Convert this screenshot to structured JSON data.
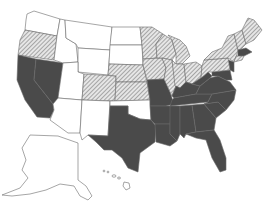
{
  "map": {
    "type": "choropleth",
    "region": "United States",
    "colors": {
      "none": "#ffffff",
      "hatched": "#b8b8b8",
      "dark": "#4a4a4a",
      "border": "#6a6a6a"
    },
    "categories": {
      "none": [
        "WA",
        "ID",
        "MT",
        "WY",
        "ND",
        "SD",
        "UT",
        "AZ",
        "NM",
        "OK",
        "AK",
        "HI"
      ],
      "hatched": [
        "OR",
        "CO",
        "NE",
        "KS",
        "MN",
        "IA",
        "WI",
        "IL",
        "MI",
        "IN",
        "OH",
        "PA",
        "NY",
        "VT",
        "NH",
        "ME",
        "MA",
        "CT",
        "RI"
      ],
      "dark": [
        "CA",
        "NV",
        "TX",
        "MO",
        "AR",
        "LA",
        "MS",
        "AL",
        "TN",
        "KY",
        "WV",
        "VA",
        "NC",
        "SC",
        "GA",
        "FL",
        "MD",
        "DE",
        "NJ",
        "DC"
      ]
    }
  }
}
